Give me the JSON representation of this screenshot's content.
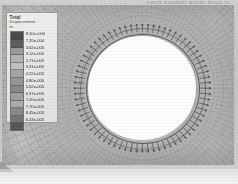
{
  "figure": {
    "kind": "fea-contour-plot",
    "header_note": "FINITE ELEMENT MODEL RESULTS",
    "background_color": "#c9c9c7",
    "hole_fill_color": "#fcfcfb"
  },
  "legend": {
    "title": "Total",
    "subtitle": "Displacement",
    "unit_marker": "m",
    "box_color": "#ededeb",
    "labels": [
      "8.10e+000",
      "7.20e-004",
      "3.62e-005",
      "3.12e-005",
      "2.71e-005",
      "3.31e-005",
      "4.22e-005",
      "4.80e-005",
      "5.62e-005",
      "6.37e-005",
      "7.20e-005",
      "7.70e-005",
      "8.45e-005",
      "6.43e-005"
    ],
    "band_colors": [
      "#4c4c4c",
      "#5e5e5e",
      "#9d9d9d",
      "#b7b7b7",
      "#c6c6c6",
      "#a9a9a9",
      "#9a9a9a",
      "#8d8d8d",
      "#a3a3a3",
      "#b4b4b4",
      "#8f8f8f",
      "#7a7a7a",
      "#565656"
    ]
  },
  "chart_data": {
    "type": "heatmap",
    "title": "Total Displacement",
    "subtitle": "Contour plot of total displacement around a circular hole",
    "xlabel": "",
    "ylabel": "",
    "colorbar_label": "Total Displacement",
    "colorbar_ticks": [
      "8.10e+000",
      "7.20e-004",
      "3.62e-005",
      "3.12e-005",
      "2.71e-005",
      "3.31e-005",
      "4.22e-005",
      "4.80e-005",
      "5.62e-005",
      "6.37e-005",
      "7.20e-005",
      "7.70e-005",
      "8.45e-005",
      "6.43e-005"
    ],
    "colormap": "grayscale",
    "grid": false,
    "legend_position": "left",
    "annotations": [
      "Radial displacement vectors drawn around the hole boundary",
      "Circular hole at plot center is undeformed / unmeshed (white)"
    ],
    "geometry": {
      "hole_center_x_pct": 60.5,
      "hole_center_y_pct": 52.0,
      "hole_radius_px": 54,
      "vector_count": 72
    }
  }
}
